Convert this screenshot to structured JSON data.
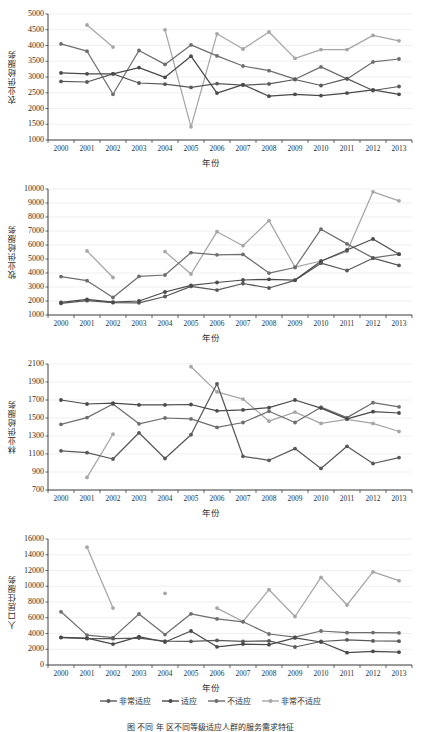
{
  "figure": {
    "xlabel": "年份",
    "caption": "图      不同      年           区不同等级适应人群的服务需求特征",
    "years": [
      "2000",
      "2001",
      "2002",
      "2003",
      "2004",
      "2005",
      "2006",
      "2007",
      "2008",
      "2009",
      "2010",
      "2011",
      "2012",
      "2013"
    ],
    "series_names": [
      "非常适应",
      "适应",
      "不适应",
      "非常不适应"
    ],
    "colors": {
      "s1": "#595959",
      "s2": "#4a4a4a",
      "s3": "#6e6e6e",
      "s4": "#a6a6a6",
      "axis": "#404040",
      "grid": "#e8e8e8",
      "background": "#ffffff"
    }
  },
  "legend": {
    "items": [
      {
        "label": "非常适应",
        "color": "#595959"
      },
      {
        "label": "适应",
        "color": "#4a4a4a"
      },
      {
        "label": "不适应",
        "color": "#6e6e6e"
      },
      {
        "label": "非常不适应",
        "color": "#a6a6a6"
      }
    ]
  },
  "chart_data": [
    {
      "type": "line",
      "title": "农业供给服务",
      "ylabel": "农业供给服务",
      "xlabel": "年份",
      "grid": true,
      "legend_position": "bottom",
      "ylim": [
        1000,
        5000
      ],
      "yticks": [
        1000,
        1500,
        2000,
        2500,
        3000,
        3500,
        4000,
        4500,
        5000
      ],
      "categories": [
        "2000",
        "2001",
        "2002",
        "2003",
        "2004",
        "2005",
        "2006",
        "2007",
        "2008",
        "2009",
        "2010",
        "2011",
        "2012",
        "2013"
      ],
      "series": [
        {
          "name": "非常适应",
          "color": "#595959",
          "values": [
            2860,
            2840,
            3100,
            2810,
            2770,
            2670,
            2790,
            2740,
            2780,
            2920,
            2730,
            2950,
            2570,
            2700
          ]
        },
        {
          "name": "适应",
          "color": "#4a4a4a",
          "values": [
            3130,
            3100,
            3100,
            3300,
            2990,
            3660,
            2490,
            2760,
            2390,
            2450,
            2410,
            2490,
            2590,
            2450
          ]
        },
        {
          "name": "不适应",
          "color": "#6e6e6e",
          "values": [
            4050,
            3820,
            2450,
            3840,
            3400,
            4020,
            3670,
            3350,
            3200,
            2930,
            3320,
            2940,
            3480,
            3570
          ]
        },
        {
          "name": "非常不适应",
          "color": "#a6a6a6",
          "values": [
            null,
            4650,
            3950,
            null,
            4500,
            1420,
            4370,
            3890,
            4430,
            3590,
            3870,
            3870,
            4320,
            4150
          ]
        }
      ]
    },
    {
      "type": "line",
      "title": "牧业供给服务",
      "ylabel": "牧业供给服务",
      "xlabel": "年份",
      "grid": true,
      "legend_position": "bottom",
      "ylim": [
        1000,
        10000
      ],
      "yticks": [
        1000,
        2000,
        3000,
        4000,
        5000,
        6000,
        7000,
        8000,
        9000,
        10000
      ],
      "categories": [
        "2000",
        "2001",
        "2002",
        "2003",
        "2004",
        "2005",
        "2006",
        "2007",
        "2008",
        "2009",
        "2010",
        "2011",
        "2012",
        "2013"
      ],
      "series": [
        {
          "name": "非常适应",
          "color": "#595959",
          "values": [
            1830,
            2020,
            1880,
            1870,
            2320,
            3040,
            2780,
            3250,
            2930,
            3480,
            4700,
            4180,
            5060,
            4540
          ]
        },
        {
          "name": "适应",
          "color": "#4a4a4a",
          "values": [
            1900,
            2120,
            1920,
            2000,
            2640,
            3120,
            3320,
            3500,
            3550,
            3490,
            4840,
            5640,
            6430,
            5340
          ]
        },
        {
          "name": "不适应",
          "color": "#6e6e6e",
          "values": [
            3740,
            3450,
            2250,
            3760,
            3860,
            5460,
            5300,
            5330,
            3990,
            4390,
            7130,
            6080,
            5080,
            5340
          ]
        },
        {
          "name": "非常不适应",
          "color": "#a6a6a6",
          "values": [
            null,
            5580,
            3680,
            null,
            5530,
            3930,
            6950,
            5950,
            7740,
            4420,
            4860,
            5540,
            9800,
            9160
          ]
        }
      ]
    },
    {
      "type": "line",
      "title": "林业供给服务",
      "ylabel": "林业供给服务",
      "xlabel": "年份",
      "grid": true,
      "legend_position": "bottom",
      "ylim": [
        700,
        2100
      ],
      "yticks": [
        700,
        900,
        1100,
        1300,
        1500,
        1700,
        1900,
        2100
      ],
      "categories": [
        "2000",
        "2001",
        "2002",
        "2003",
        "2004",
        "2005",
        "2006",
        "2007",
        "2008",
        "2009",
        "2010",
        "2011",
        "2012",
        "2013"
      ],
      "series": [
        {
          "name": "非常适应",
          "color": "#595959",
          "values": [
            1135,
            1115,
            1045,
            1335,
            1050,
            1315,
            1880,
            1075,
            1030,
            1160,
            940,
            1185,
            995,
            1060
          ]
        },
        {
          "name": "适应",
          "color": "#4a4a4a",
          "values": [
            1700,
            1655,
            1665,
            1645,
            1645,
            1650,
            1580,
            1590,
            1615,
            1700,
            1610,
            1490,
            1570,
            1555
          ]
        },
        {
          "name": "不适应",
          "color": "#6e6e6e",
          "values": [
            1430,
            1505,
            1655,
            1435,
            1500,
            1490,
            1395,
            1450,
            1575,
            1450,
            1620,
            1505,
            1670,
            1625
          ]
        },
        {
          "name": "非常不适应",
          "color": "#a6a6a6",
          "values": [
            null,
            840,
            1320,
            null,
            null,
            2070,
            1790,
            1710,
            1465,
            1565,
            1440,
            1485,
            1440,
            1350
          ]
        }
      ]
    },
    {
      "type": "line",
      "title": "人口居住服务",
      "ylabel": "人口居住服务",
      "xlabel": "年份",
      "grid": true,
      "legend_position": "bottom",
      "ylim": [
        0,
        16000
      ],
      "yticks": [
        0,
        2000,
        4000,
        6000,
        8000,
        10000,
        12000,
        14000,
        16000
      ],
      "categories": [
        "2000",
        "2001",
        "2002",
        "2003",
        "2004",
        "2005",
        "2006",
        "2007",
        "2008",
        "2009",
        "2010",
        "2011",
        "2012",
        "2013"
      ],
      "series": [
        {
          "name": "非常适应",
          "color": "#595959",
          "values": [
            3480,
            3340,
            3340,
            3420,
            3040,
            3000,
            3120,
            3000,
            3060,
            2290,
            2980,
            3200,
            3060,
            3020
          ]
        },
        {
          "name": "适应",
          "color": "#4a4a4a",
          "values": [
            3520,
            3420,
            2660,
            3600,
            2920,
            4320,
            2310,
            2660,
            2580,
            3440,
            2920,
            1560,
            1740,
            1620
          ]
        },
        {
          "name": "不适应",
          "color": "#6e6e6e",
          "values": [
            6760,
            3800,
            3480,
            6480,
            3860,
            6500,
            5860,
            5480,
            3940,
            3540,
            4320,
            4100,
            4120,
            4080
          ]
        },
        {
          "name": "非常不适应",
          "color": "#a6a6a6",
          "values": [
            null,
            14960,
            7220,
            null,
            9100,
            null,
            7220,
            5520,
            9560,
            6160,
            11120,
            7620,
            11820,
            10700
          ]
        }
      ]
    }
  ]
}
